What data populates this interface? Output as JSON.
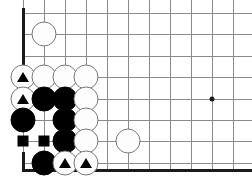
{
  "board": {
    "kind": "go-board-diagram",
    "description": "Go board corner diagram, lower-left corner",
    "line_color": "#8a8a8a",
    "edge_color": "#1a1a1a",
    "background_color": "#ffffff",
    "black_color": "#000000",
    "white_color": "#fdfdfd",
    "white_outline_color": "#777777",
    "cell_size": 21,
    "origin_x": 23,
    "origin_y": 13,
    "columns": 11,
    "rows": 8,
    "left_edge_is_border": true,
    "bottom_edge_is_border": true,
    "left_edge_x": 23,
    "bottom_edge_y": 169,
    "grid_x": [
      23,
      44,
      65,
      86,
      107,
      128,
      149,
      170,
      191,
      212,
      233
    ],
    "grid_y": [
      13,
      34,
      56,
      77,
      99,
      120,
      141,
      163
    ],
    "star_points": [
      {
        "name": "hoshi-4-4",
        "col": 9,
        "row": 4,
        "x": 212,
        "y": 99
      }
    ],
    "stones": [
      {
        "id": "w-c1-r1",
        "color": "white",
        "col": 1,
        "row": 1,
        "x": 44,
        "y": 34,
        "mark": "none"
      },
      {
        "id": "w-c0-r3",
        "color": "white",
        "col": 0,
        "row": 3,
        "x": 23,
        "y": 77,
        "mark": "triangle"
      },
      {
        "id": "w-c1-r3",
        "color": "white",
        "col": 1,
        "row": 3,
        "x": 44,
        "y": 77,
        "mark": "none"
      },
      {
        "id": "w-c2-r3",
        "color": "white",
        "col": 2,
        "row": 3,
        "x": 65,
        "y": 77,
        "mark": "none"
      },
      {
        "id": "w-c3-r3",
        "color": "white",
        "col": 3,
        "row": 3,
        "x": 86,
        "y": 77,
        "mark": "none"
      },
      {
        "id": "w-c0-r4",
        "color": "white",
        "col": 0,
        "row": 4,
        "x": 23,
        "y": 99,
        "mark": "triangle"
      },
      {
        "id": "b-c1-r4",
        "color": "black",
        "col": 1,
        "row": 4,
        "x": 44,
        "y": 99,
        "mark": "none"
      },
      {
        "id": "b-c2-r4",
        "color": "black",
        "col": 2,
        "row": 4,
        "x": 65,
        "y": 99,
        "mark": "none"
      },
      {
        "id": "w-c3-r4",
        "color": "white",
        "col": 3,
        "row": 4,
        "x": 86,
        "y": 99,
        "mark": "none"
      },
      {
        "id": "b-c0-r5",
        "color": "black",
        "col": 0,
        "row": 5,
        "x": 23,
        "y": 120,
        "mark": "none"
      },
      {
        "id": "b-c2-r5",
        "color": "black",
        "col": 2,
        "row": 5,
        "x": 65,
        "y": 120,
        "mark": "none"
      },
      {
        "id": "w-c3-r5",
        "color": "white",
        "col": 3,
        "row": 5,
        "x": 86,
        "y": 120,
        "mark": "none"
      },
      {
        "id": "b-c2-r6",
        "color": "black",
        "col": 2,
        "row": 6,
        "x": 65,
        "y": 141,
        "mark": "none"
      },
      {
        "id": "w-c3-r6",
        "color": "white",
        "col": 3,
        "row": 6,
        "x": 86,
        "y": 141,
        "mark": "none"
      },
      {
        "id": "w-c5-r6",
        "color": "white",
        "col": 5,
        "row": 6,
        "x": 128,
        "y": 141,
        "mark": "none"
      },
      {
        "id": "b-c1-r7",
        "color": "black",
        "col": 1,
        "row": 7,
        "x": 44,
        "y": 163,
        "mark": "none"
      },
      {
        "id": "w-c2-r7",
        "color": "white",
        "col": 2,
        "row": 7,
        "x": 65,
        "y": 163,
        "mark": "triangle"
      },
      {
        "id": "w-c3-r7",
        "color": "white",
        "col": 3,
        "row": 7,
        "x": 86,
        "y": 163,
        "mark": "triangle"
      }
    ],
    "square_marks": [
      {
        "id": "sq-c0-r6",
        "col": 0,
        "row": 6,
        "x": 23,
        "y": 141
      },
      {
        "id": "sq-c1-r6",
        "col": 1,
        "row": 6,
        "x": 44,
        "y": 141
      }
    ]
  }
}
